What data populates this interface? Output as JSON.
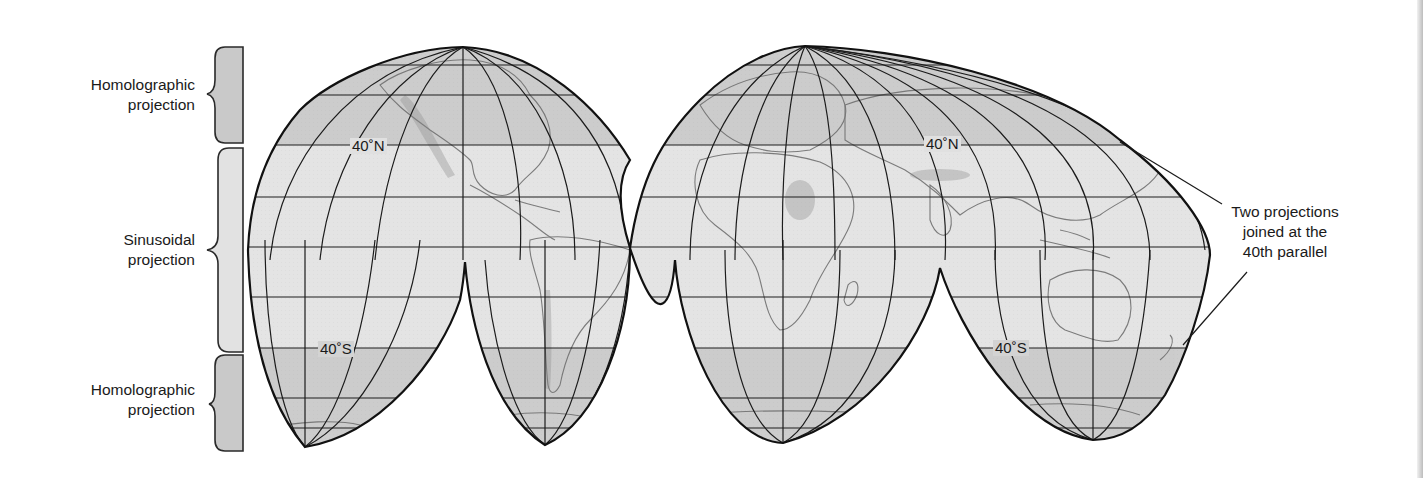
{
  "figure": {
    "side_labels": [
      {
        "id": "top",
        "line1": "Homolographic",
        "line2": "projection"
      },
      {
        "id": "middle",
        "line1": "Sinusoidal",
        "line2": "projection"
      },
      {
        "id": "bottom",
        "line1": "Homolographic",
        "line2": "projection"
      }
    ],
    "latitude_labels": [
      {
        "text": "40˚N",
        "where": "north-america-lobe"
      },
      {
        "text": "40˚N",
        "where": "eurasia-lobe"
      },
      {
        "text": "40˚S",
        "where": "pacific-west-lobe"
      },
      {
        "text": "40˚S",
        "where": "indian-ocean-lobe"
      }
    ],
    "callout": {
      "line1": "Two projections",
      "line2": "joined at the",
      "line3": "40th parallel"
    },
    "colors": {
      "sinusoidal_fill": "#e4e4e4",
      "homolographic_fill": "#cdcdcd",
      "gridline": "#1c1c1c",
      "coastline": "#6e6e6e",
      "brace_fill_dark": "#c9c9c9",
      "brace_fill_light": "#e2e2e2"
    }
  }
}
